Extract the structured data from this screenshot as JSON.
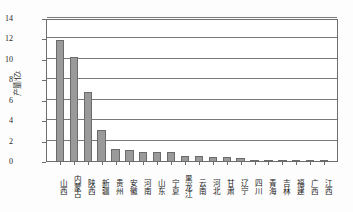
{
  "chart_data": {
    "type": "bar",
    "title": "",
    "xlabel": "",
    "ylabel": "产量/亿t",
    "ylim": [
      0,
      14
    ],
    "ytick_labels": [
      "0",
      "2",
      "4",
      "6",
      "8",
      "10",
      "12",
      "14"
    ],
    "ytick_values": [
      0,
      2,
      4,
      6,
      8,
      10,
      12,
      14
    ],
    "grid": true,
    "legend": "none",
    "bar_color": "#9a9a9a",
    "bar_edge_color": "#6b6b6b",
    "axis_color": "#6e6e6e",
    "categories": [
      "山西",
      "内蒙古",
      "陕西",
      "新疆",
      "贵州",
      "安徽",
      "河南",
      "山东",
      "宁夏",
      "黑龙江",
      "云南",
      "河北",
      "甘肃",
      "辽宁",
      "四川",
      "青海",
      "吉林",
      "福建",
      "广西",
      "江西"
    ],
    "values": [
      11.9,
      10.3,
      6.9,
      3.1,
      1.3,
      1.15,
      0.95,
      0.95,
      0.95,
      0.6,
      0.6,
      0.45,
      0.45,
      0.35,
      0.12,
      0.05,
      0.03,
      0.02,
      0.01,
      0.01
    ]
  }
}
